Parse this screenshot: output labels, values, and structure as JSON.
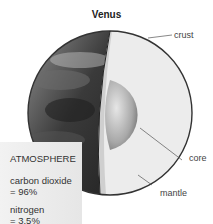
{
  "title": "Venus",
  "labels": {
    "crust": "crust",
    "core": "core",
    "mantle": "mantle"
  },
  "atmosphere": {
    "heading": "ATMOSPHERE",
    "items": [
      {
        "name": "carbon dioxide",
        "value": "= 96%"
      },
      {
        "name": "nitrogen",
        "value": "= 3.5%"
      }
    ]
  }
}
